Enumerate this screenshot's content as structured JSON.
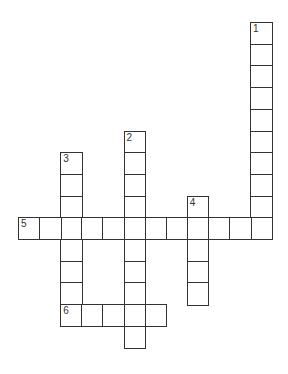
{
  "puzzle": {
    "type": "crossword",
    "grid": {
      "origin_x": 18,
      "origin_y": 22,
      "cell_w": 21.1,
      "cell_h": 21.7,
      "border_color": "#333333"
    },
    "entries": [
      {
        "number": "1",
        "direction": "down",
        "row": 0,
        "col": 11,
        "length": 10
      },
      {
        "number": "2",
        "direction": "down",
        "row": 5,
        "col": 5,
        "length": 10
      },
      {
        "number": "3",
        "direction": "down",
        "row": 6,
        "col": 2,
        "length": 8
      },
      {
        "number": "4",
        "direction": "down",
        "row": 8,
        "col": 8,
        "length": 5
      },
      {
        "number": "5",
        "direction": "across",
        "row": 9,
        "col": 0,
        "length": 12
      },
      {
        "number": "6",
        "direction": "across",
        "row": 13,
        "col": 2,
        "length": 5
      }
    ]
  }
}
